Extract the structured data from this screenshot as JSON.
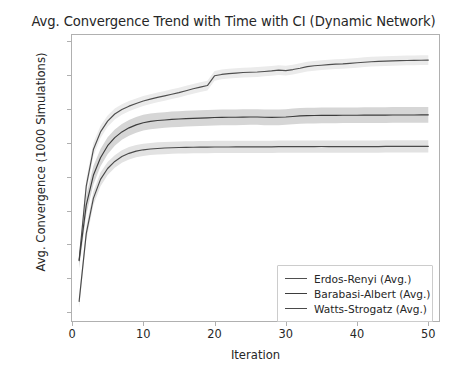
{
  "chart_data": {
    "type": "line",
    "title": "Avg. Convergence Trend with Time with CI (Dynamic Network)",
    "xlabel": "Iteration",
    "ylabel": "Avg. Convergence (1000 Simulations)",
    "xlim": [
      0,
      51.5
    ],
    "ylim": [
      0.3935,
      0.6045
    ],
    "xticks": [
      0,
      10,
      20,
      30,
      40,
      50
    ],
    "xtick_labels": [
      "0",
      "10",
      "20",
      "30",
      "40",
      "50"
    ],
    "yticks": [
      0.4,
      0.425,
      0.45,
      0.475,
      0.5,
      0.525,
      0.55,
      0.575,
      0.6
    ],
    "ytick_labels": [
      "0.400",
      "0.425",
      "0.450",
      "0.475",
      "0.500",
      "0.525",
      "0.550",
      "0.575",
      "0.600"
    ],
    "grid": false,
    "legend_position": "lower right",
    "x": [
      1,
      2,
      3,
      4,
      5,
      6,
      7,
      8,
      9,
      10,
      11,
      12,
      13,
      14,
      15,
      16,
      17,
      18,
      19,
      20,
      21,
      22,
      23,
      24,
      25,
      26,
      27,
      28,
      29,
      30,
      31,
      32,
      33,
      34,
      35,
      36,
      37,
      38,
      39,
      40,
      41,
      42,
      43,
      44,
      45,
      46,
      47,
      48,
      49,
      50
    ],
    "series": [
      {
        "name": "Erdos-Renyi (Avg.)",
        "color": "#4f4f4f",
        "ci_color": "#ebebeb",
        "values": [
          0.4385,
          0.493,
          0.52,
          0.533,
          0.541,
          0.5462,
          0.5495,
          0.552,
          0.554,
          0.5558,
          0.5572,
          0.5585,
          0.5596,
          0.5608,
          0.562,
          0.5634,
          0.5648,
          0.566,
          0.5672,
          0.5744,
          0.5754,
          0.576,
          0.5764,
          0.5768,
          0.577,
          0.5772,
          0.5776,
          0.578,
          0.5786,
          0.5782,
          0.579,
          0.58,
          0.5812,
          0.5818,
          0.5822,
          0.5826,
          0.583,
          0.5832,
          0.5836,
          0.584,
          0.5844,
          0.5848,
          0.585,
          0.5852,
          0.5854,
          0.5856,
          0.5857,
          0.5858,
          0.5859,
          0.586
        ],
        "ci_lower": [
          0.4345,
          0.488,
          0.515,
          0.5285,
          0.5368,
          0.5422,
          0.5456,
          0.5482,
          0.5503,
          0.5521,
          0.5536,
          0.5549,
          0.556,
          0.5572,
          0.5584,
          0.5598,
          0.5612,
          0.5624,
          0.5636,
          0.5708,
          0.5718,
          0.5724,
          0.5728,
          0.5732,
          0.5734,
          0.5736,
          0.574,
          0.5744,
          0.575,
          0.5746,
          0.5754,
          0.5764,
          0.5776,
          0.5782,
          0.5786,
          0.579,
          0.5794,
          0.5796,
          0.58,
          0.5804,
          0.5808,
          0.5812,
          0.5814,
          0.5816,
          0.5818,
          0.582,
          0.5821,
          0.5822,
          0.5823,
          0.5824
        ],
        "ci_upper": [
          0.4425,
          0.498,
          0.525,
          0.5375,
          0.5452,
          0.5502,
          0.5534,
          0.5558,
          0.5577,
          0.5595,
          0.5608,
          0.5621,
          0.5632,
          0.5644,
          0.5656,
          0.567,
          0.5684,
          0.5696,
          0.5708,
          0.578,
          0.579,
          0.5796,
          0.58,
          0.5804,
          0.5806,
          0.5808,
          0.5812,
          0.5816,
          0.5822,
          0.5818,
          0.5826,
          0.5836,
          0.5848,
          0.5854,
          0.5858,
          0.5862,
          0.5866,
          0.5868,
          0.5872,
          0.5876,
          0.588,
          0.5884,
          0.5886,
          0.5888,
          0.589,
          0.5892,
          0.5893,
          0.5894,
          0.5895,
          0.5896
        ]
      },
      {
        "name": "Barabasi-Albert (Avg.)",
        "color": "#3d3d3d",
        "ci_color": "#d6d6d6",
        "values": [
          0.438,
          0.479,
          0.501,
          0.514,
          0.5228,
          0.5288,
          0.533,
          0.536,
          0.5382,
          0.5398,
          0.5408,
          0.5414,
          0.5418,
          0.5422,
          0.5425,
          0.5428,
          0.543,
          0.5432,
          0.5434,
          0.5436,
          0.5437,
          0.5438,
          0.5438,
          0.5439,
          0.544,
          0.544,
          0.5438,
          0.5437,
          0.5438,
          0.544,
          0.5444,
          0.5448,
          0.545,
          0.5451,
          0.5452,
          0.5452,
          0.5452,
          0.5453,
          0.5453,
          0.5453,
          0.5454,
          0.5454,
          0.5454,
          0.5454,
          0.5455,
          0.5455,
          0.5455,
          0.5455,
          0.5456,
          0.5456
        ],
        "ci_lower": [
          0.432,
          0.472,
          0.4942,
          0.5076,
          0.5166,
          0.5228,
          0.5272,
          0.5302,
          0.5324,
          0.534,
          0.535,
          0.5356,
          0.536,
          0.5364,
          0.5367,
          0.537,
          0.5372,
          0.5374,
          0.5376,
          0.5378,
          0.5379,
          0.538,
          0.538,
          0.5381,
          0.5382,
          0.5382,
          0.538,
          0.5379,
          0.538,
          0.5382,
          0.5386,
          0.539,
          0.5392,
          0.5393,
          0.5394,
          0.5394,
          0.5394,
          0.5395,
          0.5395,
          0.5395,
          0.5396,
          0.5396,
          0.5396,
          0.5396,
          0.5397,
          0.5397,
          0.5397,
          0.5397,
          0.5398,
          0.5398
        ],
        "ci_upper": [
          0.444,
          0.486,
          0.5078,
          0.5204,
          0.529,
          0.5348,
          0.5388,
          0.5418,
          0.544,
          0.5456,
          0.5466,
          0.5472,
          0.5476,
          0.548,
          0.5483,
          0.5486,
          0.5488,
          0.549,
          0.5492,
          0.5494,
          0.5495,
          0.5496,
          0.5496,
          0.5497,
          0.5498,
          0.5498,
          0.5496,
          0.5495,
          0.5496,
          0.5498,
          0.5502,
          0.5506,
          0.5508,
          0.5509,
          0.551,
          0.551,
          0.551,
          0.5511,
          0.5511,
          0.5511,
          0.5512,
          0.5512,
          0.5512,
          0.5512,
          0.5513,
          0.5513,
          0.5513,
          0.5513,
          0.5514,
          0.5514
        ]
      },
      {
        "name": "Watts-Strogatz (Avg.)",
        "color": "#4a4a4a",
        "ci_color": "#e2e2e2",
        "values": [
          0.408,
          0.458,
          0.484,
          0.498,
          0.506,
          0.5112,
          0.5148,
          0.5172,
          0.5188,
          0.5198,
          0.5204,
          0.5208,
          0.5211,
          0.5213,
          0.5215,
          0.5216,
          0.5217,
          0.5218,
          0.5218,
          0.5219,
          0.5219,
          0.5219,
          0.522,
          0.522,
          0.522,
          0.522,
          0.522,
          0.522,
          0.5221,
          0.5221,
          0.5221,
          0.5221,
          0.5221,
          0.5221,
          0.5222,
          0.5222,
          0.5222,
          0.5222,
          0.5222,
          0.5222,
          0.5222,
          0.5222,
          0.5222,
          0.5223,
          0.5223,
          0.5223,
          0.5223,
          0.5223,
          0.5223,
          0.5223
        ],
        "ci_lower": [
          0.4035,
          0.453,
          0.479,
          0.493,
          0.5012,
          0.5066,
          0.5102,
          0.5126,
          0.5143,
          0.5153,
          0.5159,
          0.5163,
          0.5166,
          0.5168,
          0.517,
          0.5171,
          0.5172,
          0.5173,
          0.5173,
          0.5174,
          0.5174,
          0.5174,
          0.5175,
          0.5175,
          0.5175,
          0.5175,
          0.5175,
          0.5175,
          0.5176,
          0.5176,
          0.5176,
          0.5176,
          0.5176,
          0.5176,
          0.5177,
          0.5177,
          0.5177,
          0.5177,
          0.5177,
          0.5177,
          0.5177,
          0.5177,
          0.5177,
          0.5178,
          0.5178,
          0.5178,
          0.5178,
          0.5178,
          0.5178,
          0.5178
        ],
        "ci_upper": [
          0.4125,
          0.463,
          0.489,
          0.503,
          0.5108,
          0.5158,
          0.5194,
          0.5218,
          0.5233,
          0.5243,
          0.5249,
          0.5253,
          0.5256,
          0.5258,
          0.526,
          0.5261,
          0.5262,
          0.5263,
          0.5263,
          0.5264,
          0.5264,
          0.5264,
          0.5265,
          0.5265,
          0.5265,
          0.5265,
          0.5265,
          0.5265,
          0.5266,
          0.5266,
          0.5266,
          0.5266,
          0.5266,
          0.5266,
          0.5267,
          0.5267,
          0.5267,
          0.5267,
          0.5267,
          0.5267,
          0.5267,
          0.5267,
          0.5267,
          0.5268,
          0.5268,
          0.5268,
          0.5268,
          0.5268,
          0.5268,
          0.5268
        ]
      }
    ]
  },
  "legend": {
    "items": [
      {
        "label": "Erdos-Renyi (Avg.)",
        "color": "#4f4f4f"
      },
      {
        "label": "Barabasi-Albert (Avg.)",
        "color": "#3d3d3d"
      },
      {
        "label": "Watts-Strogatz (Avg.)",
        "color": "#4a4a4a"
      }
    ]
  },
  "style": {
    "axis_color": "#b0b0b0",
    "text_color": "#262626",
    "background": "#ffffff"
  }
}
